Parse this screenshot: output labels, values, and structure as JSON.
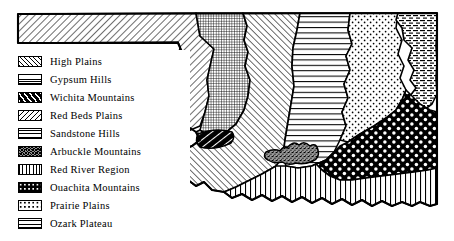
{
  "figure": {
    "kind": "physiographic-region-map",
    "background_color": "#ffffff",
    "ink_color": "#000000"
  },
  "legend": {
    "items": [
      {
        "label": "High Plains",
        "pattern": "diagonal-hatch-right",
        "swatch_class": "sw-high-plains"
      },
      {
        "label": "Gypsum  Hills",
        "pattern": "fine-crosshatch-grid",
        "swatch_class": "sw-gypsum-hills"
      },
      {
        "label": "Wichita  Mountains",
        "pattern": "black-white-diagonal-stripes",
        "swatch_class": "sw-wichita-mountains"
      },
      {
        "label": "Red Beds  Plains",
        "pattern": "diagonal-hatch-left",
        "swatch_class": "sw-red-beds-plains"
      },
      {
        "label": "Sandstone  Hills",
        "pattern": "horizontal-lines",
        "swatch_class": "sw-sandstone-hills"
      },
      {
        "label": "Arbuckle  Mountains",
        "pattern": "dark-speckle-stipple",
        "swatch_class": "sw-arbuckle-mountains"
      },
      {
        "label": "Red  River  Region",
        "pattern": "vertical-lines",
        "swatch_class": "sw-red-river-region"
      },
      {
        "label": "Ouachita  Mountains",
        "pattern": "black-with-white-dots",
        "swatch_class": "sw-ouachita-mountains"
      },
      {
        "label": "Prairie Plains",
        "pattern": "white-with-black-dots",
        "swatch_class": "sw-prairie-plains"
      },
      {
        "label": "Ozark Plateau",
        "pattern": "horizontal-dashes",
        "swatch_class": "sw-ozark-plateau"
      }
    ]
  },
  "map_regions": [
    {
      "name": "High Plains",
      "pattern": "diagonal-hatch-right",
      "location": "panhandle-and-far-west"
    },
    {
      "name": "Gypsum Hills",
      "pattern": "fine-crosshatch-grid",
      "location": "narrow-north-south-band-west"
    },
    {
      "name": "Red Beds Plains",
      "pattern": "diagonal-hatch-left",
      "location": "large-central-west"
    },
    {
      "name": "Wichita Mountains",
      "pattern": "black-white-diagonal-stripes",
      "location": "small-ellipse-southwest"
    },
    {
      "name": "Sandstone Hills",
      "pattern": "horizontal-lines",
      "location": "central-north-south-band"
    },
    {
      "name": "Prairie Plains",
      "pattern": "white-with-black-dots",
      "location": "northeast-and-east"
    },
    {
      "name": "Ozark Plateau",
      "pattern": "horizontal-dashes",
      "location": "far-northeast-corner"
    },
    {
      "name": "Ouachita Mountains",
      "pattern": "black-with-white-dots",
      "location": "southeast"
    },
    {
      "name": "Arbuckle Mountains",
      "pattern": "dark-speckle-stipple",
      "location": "small-blob-south-central"
    },
    {
      "name": "Red River Region",
      "pattern": "vertical-lines",
      "location": "southern-border-strip"
    }
  ]
}
